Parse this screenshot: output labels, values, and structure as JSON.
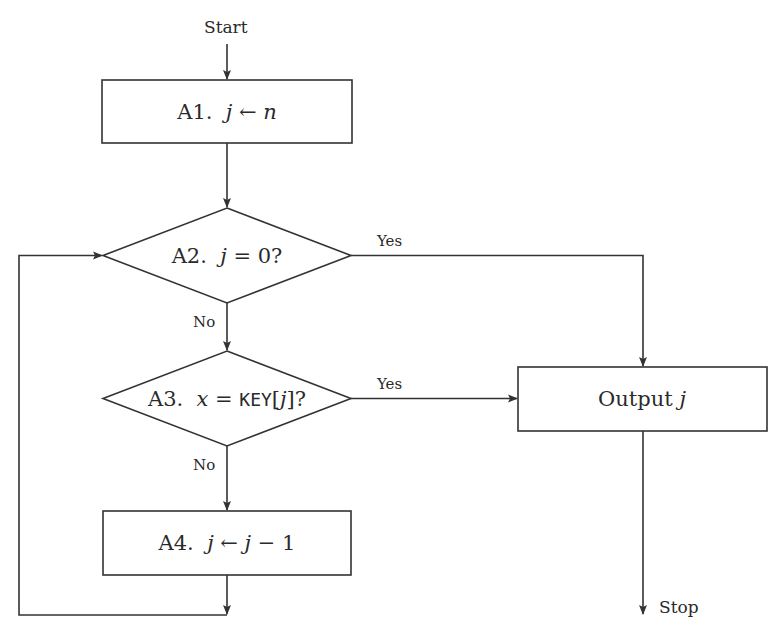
{
  "diagram": {
    "type": "flowchart",
    "title": "",
    "colors": {
      "stroke": "#333333",
      "text": "#2a2a2a",
      "background": "#ffffff"
    },
    "terminals": {
      "start": {
        "label": "Start"
      },
      "stop": {
        "label": "Stop"
      }
    },
    "nodes": {
      "a1": {
        "shape": "rectangle",
        "step": "A1.",
        "expr_var": "j",
        "expr_op": " ← ",
        "expr_rhs": "n"
      },
      "a2": {
        "shape": "diamond",
        "step": "A2.",
        "expr_var": "j",
        "expr_op": " = ",
        "expr_rhs": "0?"
      },
      "a3": {
        "shape": "diamond",
        "step": "A3.",
        "expr_var": "x",
        "expr_op": " = ",
        "expr_key": "KEY",
        "expr_open": "[",
        "expr_idx": "j",
        "expr_close": "]?"
      },
      "a4": {
        "shape": "rectangle",
        "step": "A4.",
        "expr_var": "j",
        "expr_op": " ← ",
        "expr_rhs_var": "j",
        "expr_rhs_rest": " − 1"
      },
      "output": {
        "shape": "rectangle",
        "text": "Output",
        "var": "j"
      }
    },
    "edges": [
      {
        "from": "start",
        "to": "a1",
        "label": ""
      },
      {
        "from": "a1",
        "to": "a2",
        "label": ""
      },
      {
        "from": "a2",
        "to": "output",
        "label": "Yes"
      },
      {
        "from": "a2",
        "to": "a3",
        "label": "No"
      },
      {
        "from": "a3",
        "to": "output",
        "label": "Yes"
      },
      {
        "from": "a3",
        "to": "a4",
        "label": "No"
      },
      {
        "from": "a4",
        "to": "a2",
        "label": ""
      },
      {
        "from": "output",
        "to": "stop",
        "label": ""
      }
    ],
    "edge_labels": {
      "a2_yes": "Yes",
      "a2_no": "No",
      "a3_yes": "Yes",
      "a3_no": "No"
    }
  }
}
